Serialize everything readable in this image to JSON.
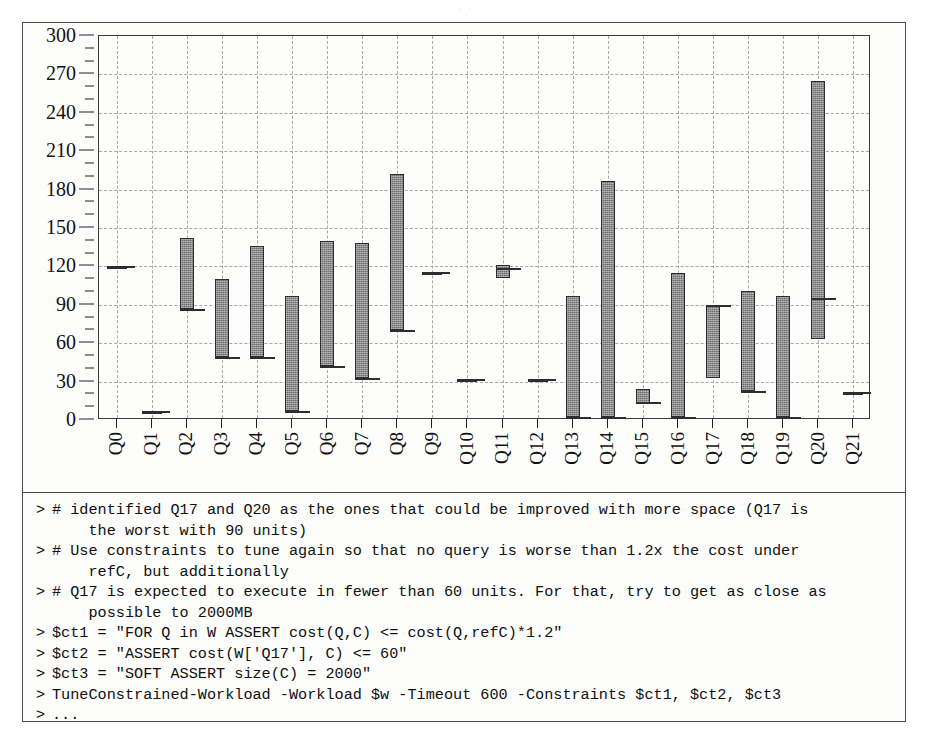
{
  "scan": {
    "artifact_text": "     .              .          "
  },
  "chart_data": {
    "type": "bar",
    "title": "",
    "xlabel": "",
    "ylabel": "",
    "ylim": [
      0,
      300
    ],
    "xlim_categories": 22,
    "grid": true,
    "legend": "none",
    "y_ticks_major": [
      0,
      30,
      60,
      90,
      120,
      150,
      180,
      210,
      240,
      270,
      300
    ],
    "y_ticks_minor": [
      10,
      20,
      40,
      50,
      70,
      80,
      100,
      110,
      130,
      140,
      160,
      170,
      190,
      200,
      220,
      230,
      250,
      260,
      280,
      290
    ],
    "categories": [
      "Q0",
      "Q1",
      "Q2",
      "Q3",
      "Q4",
      "Q5",
      "Q6",
      "Q7",
      "Q8",
      "Q9",
      "Q10",
      "Q11",
      "Q12",
      "Q13",
      "Q14",
      "Q15",
      "Q16",
      "Q17",
      "Q18",
      "Q19",
      "Q20",
      "Q21"
    ],
    "note": "Each category is a floating range bar (low to high cost); flat marks denote a single value; short horizontal ticks denote a reference cost.",
    "series": [
      {
        "name": "cost range (low-high)",
        "low": [
          120,
          7,
          87,
          49,
          49,
          7,
          42,
          33,
          70,
          116,
          32,
          111,
          32,
          2,
          2,
          13,
          2,
          33,
          23,
          2,
          63,
          22
        ],
        "high": [
          120,
          7,
          142,
          110,
          136,
          97,
          140,
          138,
          192,
          116,
          32,
          121,
          32,
          97,
          187,
          24,
          115,
          90,
          101,
          97,
          265,
          22
        ]
      }
    ],
    "reference_marks": [
      120,
      7,
      87,
      49,
      49,
      7,
      42,
      33,
      70,
      116,
      32,
      119,
      32,
      2,
      2,
      14,
      2,
      90,
      23,
      2,
      95,
      22
    ],
    "flat_categories": [
      "Q0",
      "Q1",
      "Q9",
      "Q10",
      "Q12",
      "Q21"
    ]
  },
  "terminal": {
    "prompt": ">",
    "lines": [
      {
        "prompt": ">",
        "text": "# identified Q17 and Q20 as the ones that could be improved with more space (Q17 is",
        "cont": "the worst with 90 units)"
      },
      {
        "prompt": ">",
        "text": "# Use constraints to tune again so that no query is worse than 1.2x the cost under",
        "cont": "refC, but additionally"
      },
      {
        "prompt": ">",
        "text": "# Q17 is expected to execute in fewer than 60 units. For that, try to get as close as",
        "cont": "possible to 2000MB"
      },
      {
        "prompt": ">",
        "text": "$ct1 = \"FOR Q in W ASSERT cost(Q,C) <= cost(Q,refC)*1.2\"",
        "cont": ""
      },
      {
        "prompt": ">",
        "text": "$ct2 = \"ASSERT cost(W['Q17'], C) <= 60\"",
        "cont": ""
      },
      {
        "prompt": ">",
        "text": "$ct3 = \"SOFT ASSERT size(C) = 2000\"",
        "cont": ""
      },
      {
        "prompt": ">",
        "text": "TuneConstrained-Workload -Workload $w -Timeout 600 -Constraints $ct1, $ct2, $ct3",
        "cont": ""
      },
      {
        "prompt": ">",
        "text": "...",
        "cont": ""
      }
    ]
  },
  "colors": {
    "bar_fill": "#6e6e6e",
    "bar_stroke": "#2d2d2d",
    "grid": "#9a9a9a",
    "axis": "#3a3a3a",
    "frame": "#4a4a4a",
    "text": "#101010",
    "background": "#fdfdfc"
  }
}
